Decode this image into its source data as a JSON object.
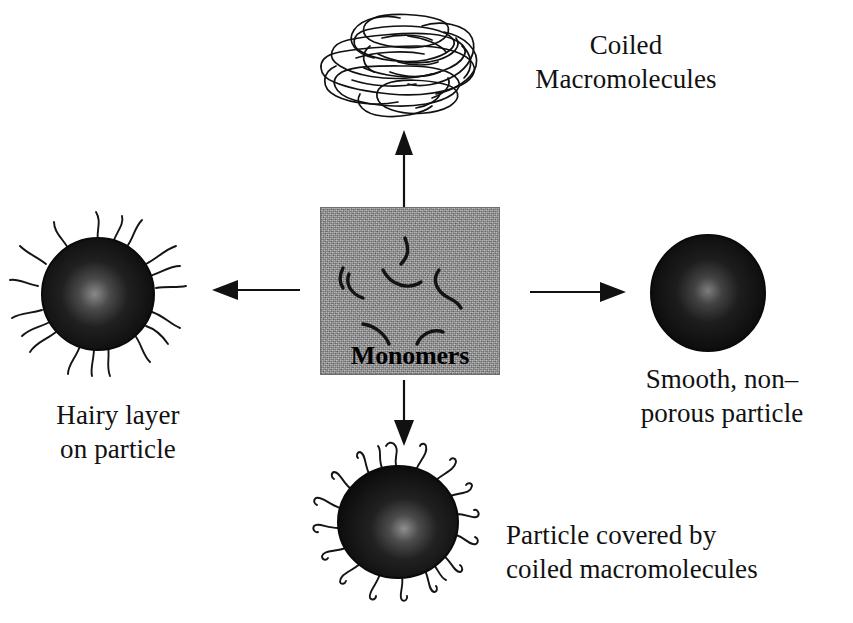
{
  "diagram": {
    "center": {
      "label": "Monomers",
      "box_fill_color": "#989898",
      "box_border_color": "#6f6f6f",
      "squiggle_color": "#141414"
    },
    "branches": [
      {
        "id": "coiled-macromolecules",
        "direction": "up",
        "label": "Coiled\nMacromolecules",
        "graphic": "tangled-coil-scribble"
      },
      {
        "id": "smooth-nonporous-particle",
        "direction": "right",
        "label": "Smooth, non–\nporous particle",
        "graphic": "dark-sphere"
      },
      {
        "id": "hairy-layer-on-particle",
        "direction": "left",
        "label": "Hairy layer\non particle",
        "graphic": "dark-sphere-with-long-hairs"
      },
      {
        "id": "particle-covered-by-coiled-macromolecules",
        "direction": "down",
        "label": "Particle covered by\ncoiled macromolecules",
        "graphic": "dark-sphere-with-curled-hairs"
      }
    ],
    "colors": {
      "background": "#ffffff",
      "text": "#111111",
      "ink": "#000000",
      "particle_dark": "#141414",
      "particle_core_highlight": "#6e6e6e"
    },
    "arrows": [
      {
        "name": "arrow-up",
        "from": "monomers",
        "to": "coiled-macromolecules"
      },
      {
        "name": "arrow-right",
        "from": "monomers",
        "to": "smooth-nonporous-particle"
      },
      {
        "name": "arrow-left",
        "from": "monomers",
        "to": "hairy-layer-on-particle"
      },
      {
        "name": "arrow-down",
        "from": "monomers",
        "to": "particle-covered-by-coiled-macromolecules"
      }
    ]
  }
}
